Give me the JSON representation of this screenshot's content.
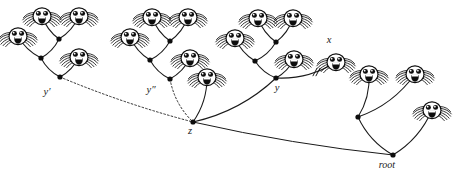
{
  "figure": {
    "background_color": "#ffffff",
    "ink_color": "#1a1a1a",
    "width": 454,
    "height": 178
  },
  "labels": [
    {
      "id": "y-prime",
      "text": "y′",
      "x": 47,
      "y": 95,
      "italic": true
    },
    {
      "id": "y-double",
      "text": "y″",
      "x": 151,
      "y": 93,
      "italic": true
    },
    {
      "id": "y",
      "text": "y",
      "x": 277,
      "y": 91,
      "italic": true
    },
    {
      "id": "x",
      "text": "x",
      "x": 329,
      "y": 43,
      "italic": true
    },
    {
      "id": "z",
      "text": "z",
      "x": 190,
      "y": 134,
      "italic": true
    },
    {
      "id": "root",
      "text": "root",
      "x": 387,
      "y": 168,
      "italic": true
    }
  ],
  "nodes": [
    {
      "id": "t1-n1",
      "x": 59,
      "y": 39,
      "kind": "dot"
    },
    {
      "id": "t1-n2",
      "x": 41,
      "y": 58,
      "kind": "dot"
    },
    {
      "id": "t1-n3",
      "x": 60,
      "y": 77,
      "kind": "dot",
      "label": "y-prime"
    },
    {
      "id": "t1-f1",
      "x": 42,
      "y": 16,
      "kind": "face"
    },
    {
      "id": "t1-f2",
      "x": 79,
      "y": 16,
      "kind": "face"
    },
    {
      "id": "t1-f3",
      "x": 18,
      "y": 36,
      "kind": "face"
    },
    {
      "id": "t1-f4",
      "x": 79,
      "y": 57,
      "kind": "face"
    },
    {
      "id": "t2-n1",
      "x": 170,
      "y": 41,
      "kind": "dot"
    },
    {
      "id": "t2-n2",
      "x": 150,
      "y": 60,
      "kind": "dot"
    },
    {
      "id": "t2-n3",
      "x": 170,
      "y": 79,
      "kind": "dot",
      "label": "y-double"
    },
    {
      "id": "t2-f1",
      "x": 152,
      "y": 17,
      "kind": "face"
    },
    {
      "id": "t2-f2",
      "x": 188,
      "y": 17,
      "kind": "face"
    },
    {
      "id": "t2-f3",
      "x": 130,
      "y": 37,
      "kind": "face"
    },
    {
      "id": "t2-f4",
      "x": 190,
      "y": 58,
      "kind": "face"
    },
    {
      "id": "t3-n1",
      "x": 276,
      "y": 42,
      "kind": "dot"
    },
    {
      "id": "t3-n2",
      "x": 255,
      "y": 61,
      "kind": "dot"
    },
    {
      "id": "t3-n3",
      "x": 276,
      "y": 78,
      "kind": "dot",
      "label": "y"
    },
    {
      "id": "t3-f1",
      "x": 258,
      "y": 18,
      "kind": "face"
    },
    {
      "id": "t3-f2",
      "x": 293,
      "y": 18,
      "kind": "face"
    },
    {
      "id": "t3-f3",
      "x": 235,
      "y": 38,
      "kind": "face"
    },
    {
      "id": "t3-f4",
      "x": 294,
      "y": 59,
      "kind": "face"
    },
    {
      "id": "t3-fx",
      "x": 336,
      "y": 62,
      "kind": "face",
      "label": "x"
    },
    {
      "id": "z",
      "x": 193,
      "y": 122,
      "kind": "dot",
      "label": "z"
    },
    {
      "id": "z-f1",
      "x": 207,
      "y": 77,
      "kind": "face"
    },
    {
      "id": "r-n1",
      "x": 358,
      "y": 117,
      "kind": "dot"
    },
    {
      "id": "r-f1",
      "x": 369,
      "y": 74,
      "kind": "face"
    },
    {
      "id": "r-f2",
      "x": 415,
      "y": 74,
      "kind": "face"
    },
    {
      "id": "r-f3",
      "x": 432,
      "y": 110,
      "kind": "face"
    },
    {
      "id": "root",
      "x": 393,
      "y": 155,
      "kind": "dot",
      "label": "root"
    }
  ],
  "edges": [
    {
      "id": "e1",
      "from": "t1-f1",
      "to": "t1-n1",
      "style": "solid"
    },
    {
      "id": "e2",
      "from": "t1-f2",
      "to": "t1-n1",
      "style": "solid"
    },
    {
      "id": "e3",
      "from": "t1-n1",
      "to": "t1-n2",
      "style": "solid"
    },
    {
      "id": "e4",
      "from": "t1-f3",
      "to": "t1-n2",
      "style": "solid"
    },
    {
      "id": "e5",
      "from": "t1-n2",
      "to": "t1-n3",
      "style": "solid"
    },
    {
      "id": "e6",
      "from": "t1-f4",
      "to": "t1-n3",
      "style": "solid"
    },
    {
      "id": "e7",
      "from": "t2-f1",
      "to": "t2-n1",
      "style": "solid"
    },
    {
      "id": "e8",
      "from": "t2-f2",
      "to": "t2-n1",
      "style": "solid"
    },
    {
      "id": "e9",
      "from": "t2-n1",
      "to": "t2-n2",
      "style": "solid"
    },
    {
      "id": "e10",
      "from": "t2-f3",
      "to": "t2-n2",
      "style": "solid"
    },
    {
      "id": "e11",
      "from": "t2-n2",
      "to": "t2-n3",
      "style": "solid"
    },
    {
      "id": "e12",
      "from": "t2-f4",
      "to": "t2-n3",
      "style": "solid"
    },
    {
      "id": "e13",
      "from": "t3-f1",
      "to": "t3-n1",
      "style": "solid"
    },
    {
      "id": "e14",
      "from": "t3-f2",
      "to": "t3-n1",
      "style": "solid"
    },
    {
      "id": "e15",
      "from": "t3-n1",
      "to": "t3-n2",
      "style": "solid"
    },
    {
      "id": "e16",
      "from": "t3-f3",
      "to": "t3-n2",
      "style": "solid"
    },
    {
      "id": "e17",
      "from": "t3-n2",
      "to": "t3-n3",
      "style": "solid"
    },
    {
      "id": "e18",
      "from": "t3-f4",
      "to": "t3-n3",
      "style": "solid"
    },
    {
      "id": "e19",
      "from": "t3-n3",
      "to": "t3-fx",
      "style": "solid",
      "cut": true
    },
    {
      "id": "e20",
      "from": "t1-n3",
      "to": "z",
      "style": "dashed"
    },
    {
      "id": "e21",
      "from": "t2-n3",
      "to": "z",
      "style": "dashed"
    },
    {
      "id": "e22",
      "from": "z",
      "to": "z-f1",
      "style": "solid"
    },
    {
      "id": "e23",
      "from": "z",
      "to": "t3-n3",
      "style": "solid"
    },
    {
      "id": "e24",
      "from": "z",
      "to": "root",
      "style": "solid"
    },
    {
      "id": "e25",
      "from": "r-f1",
      "to": "r-n1",
      "style": "solid"
    },
    {
      "id": "e26",
      "from": "r-f2",
      "to": "r-n1",
      "style": "solid"
    },
    {
      "id": "e27",
      "from": "r-n1",
      "to": "root",
      "style": "solid"
    },
    {
      "id": "e28",
      "from": "r-f3",
      "to": "root",
      "style": "solid"
    }
  ],
  "marks": [
    {
      "id": "cut-mark",
      "type": "double-slash",
      "x": 314,
      "y": 72,
      "on_edge": "e19"
    }
  ],
  "counts": {
    "faces": 16,
    "dots": 11,
    "dashed_edges": 2,
    "solid_edges": 26
  }
}
